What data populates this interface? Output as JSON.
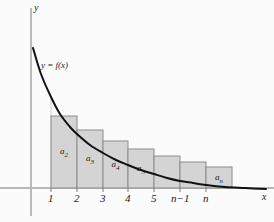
{
  "figure": {
    "background_color": "#fbfbfb",
    "curve_color": "#111111",
    "axis_color": "#b9b9b9",
    "bar_fill": "#d4d4d4",
    "bar_stroke": "#8c8c8c"
  },
  "axes": {
    "y_label": "y",
    "x_label": "x",
    "x_axis_y_px": 188,
    "y_axis_x_px": 31
  },
  "curve": {
    "label": "y = f(x)",
    "label_x_px": 41,
    "label_y_px": 60
  },
  "ticks": [
    {
      "label": "1",
      "x_px": 51
    },
    {
      "label": "2",
      "x_px": 77
    },
    {
      "label": "3",
      "x_px": 103
    },
    {
      "label": "4",
      "x_px": 128
    },
    {
      "label": "5",
      "x_px": 154
    },
    {
      "label": "n−1",
      "x_px": 180
    },
    {
      "label": "n",
      "x_px": 206
    }
  ],
  "bars": [
    {
      "label": "a",
      "sub": "2",
      "x_px": 51,
      "width_px": 26,
      "height_px": 72,
      "labeled": true
    },
    {
      "label": "a",
      "sub": "3",
      "x_px": 77,
      "width_px": 26,
      "height_px": 58,
      "labeled": true
    },
    {
      "label": "a",
      "sub": "4",
      "x_px": 103,
      "width_px": 25,
      "height_px": 47,
      "labeled": true
    },
    {
      "label": "a",
      "sub": "5",
      "x_px": 128,
      "width_px": 26,
      "height_px": 39,
      "labeled": true
    },
    {
      "label": "",
      "sub": "",
      "x_px": 154,
      "width_px": 26,
      "height_px": 32,
      "labeled": false
    },
    {
      "label": "",
      "sub": "",
      "x_px": 180,
      "width_px": 26,
      "height_px": 26,
      "labeled": false
    },
    {
      "label": "a",
      "sub": "n",
      "x_px": 206,
      "width_px": 26,
      "height_px": 21,
      "labeled": true
    }
  ],
  "chart_data": {
    "type": "area",
    "xlabel": "x",
    "ylabel": "y",
    "grid": false,
    "legend": "none",
    "categories": [
      "1–2",
      "2–3",
      "3–4",
      "4–5",
      "5–6",
      "…",
      "n−1–n"
    ],
    "bar_labels": [
      "a₂",
      "a₃",
      "a₄",
      "a₅",
      "",
      "",
      "aₙ"
    ],
    "values": [
      72,
      58,
      47,
      39,
      32,
      26,
      21
    ],
    "value_units": "pixels above x-axis",
    "xtick_labels": [
      "1",
      "2",
      "3",
      "4",
      "5",
      "n−1",
      "n"
    ],
    "curve_points": [
      [
        33,
        48
      ],
      [
        41,
        74
      ],
      [
        51,
        97
      ],
      [
        60,
        114
      ],
      [
        70,
        127
      ],
      [
        77,
        134
      ],
      [
        90,
        145
      ],
      [
        103,
        153
      ],
      [
        116,
        160
      ],
      [
        128,
        165
      ],
      [
        141,
        170
      ],
      [
        154,
        174
      ],
      [
        167,
        178
      ],
      [
        180,
        181
      ],
      [
        193,
        183
      ],
      [
        206,
        185
      ],
      [
        225,
        187
      ],
      [
        245,
        188
      ],
      [
        266,
        189
      ]
    ]
  }
}
